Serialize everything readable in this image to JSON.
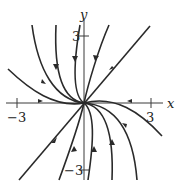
{
  "diagram": {
    "type": "phase-portrait",
    "axes": {
      "x_label": "x",
      "y_label": "y",
      "x_ticks": [
        {
          "value": -3,
          "label": "−3"
        },
        {
          "value": 3,
          "label": "3"
        }
      ],
      "y_ticks": [
        {
          "value": 3,
          "label": "3"
        },
        {
          "value": -3,
          "label": "−3"
        }
      ]
    },
    "colors": {
      "stroke": "#2a2a2a",
      "background": "#ffffff"
    }
  }
}
